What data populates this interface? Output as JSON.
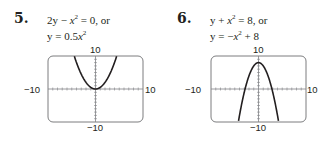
{
  "problems": [
    {
      "number": "5.",
      "equation_line1": {
        "a": "2y − ",
        "var": "x",
        "exp": "2",
        "b": " = 0, or"
      },
      "equation_line2": {
        "a": "y = 0.5",
        "var": "x",
        "exp": "2",
        "b": ""
      },
      "window": {
        "ymax_label": "10",
        "ymin_label": "−10",
        "xmin_label": "−10",
        "xmax_label": "10"
      }
    },
    {
      "number": "6.",
      "equation_line1": {
        "a": "y + ",
        "var": "x",
        "exp": "2",
        "b": " = 8, or"
      },
      "equation_line2": {
        "a": "y = −",
        "var": "x",
        "exp": "2",
        "b": " + 8"
      },
      "window": {
        "ymax_label": "10",
        "ymin_label": "−10",
        "xmin_label": "−10",
        "xmax_label": "10"
      }
    }
  ],
  "chart_data": [
    {
      "type": "line",
      "title": "2y − x^2 = 0, or y = 0.5x^2",
      "function": "y = 0.5x^2",
      "xlim": [
        -10,
        10
      ],
      "ylim": [
        -10,
        10
      ],
      "x": [
        -4.5,
        -4,
        -3,
        -2,
        -1,
        0,
        1,
        2,
        3,
        4,
        4.5
      ],
      "y": [
        10.125,
        8,
        4.5,
        2,
        0.5,
        0,
        0.5,
        2,
        4.5,
        8,
        10.125
      ],
      "xlabel": "",
      "ylabel": "",
      "tick_labels": {
        "x": [
          "−10",
          "10"
        ],
        "y": [
          "−10",
          "10"
        ]
      },
      "grid": false,
      "ticks_every": 1
    },
    {
      "type": "line",
      "title": "y + x^2 = 8, or y = −x^2 + 8",
      "function": "y = -x^2 + 8",
      "xlim": [
        -10,
        10
      ],
      "ylim": [
        -10,
        10
      ],
      "x": [
        -4.24,
        -4,
        -3,
        -2,
        -1,
        0,
        1,
        2,
        3,
        4,
        4.24
      ],
      "y": [
        -10,
        -8,
        -1,
        4,
        7,
        8,
        7,
        4,
        -1,
        -8,
        -10
      ],
      "xlabel": "",
      "ylabel": "",
      "tick_labels": {
        "x": [
          "−10",
          "10"
        ],
        "y": [
          "−10",
          "10"
        ]
      },
      "grid": false,
      "ticks_every": 1
    }
  ]
}
